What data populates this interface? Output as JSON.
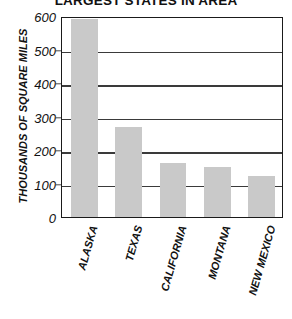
{
  "chart_data": {
    "type": "bar",
    "title": "LARGEST STATES IN AREA",
    "xlabel": "",
    "ylabel": "THOUSANDS OF SQUARE MILES",
    "categories": [
      "ALASKA",
      "TEXAS",
      "CALIFORNIA",
      "MONTANA",
      "NEW MEXICO"
    ],
    "values": [
      590,
      270,
      160,
      148,
      122
    ],
    "ylim": [
      0,
      600
    ],
    "ytick_labels": [
      "600",
      "500",
      "400",
      "300",
      "200",
      "100",
      "0"
    ],
    "ytick_values": [
      600,
      500,
      400,
      300,
      200,
      100,
      0
    ],
    "grid": true,
    "legend": false,
    "series": [
      {
        "name": "Area",
        "values": [
          590,
          270,
          160,
          148,
          122
        ]
      }
    ]
  },
  "style": {
    "bar_fill": "#c9c9c9",
    "gridline_color": "#3a3a3a",
    "frame_color": "#1a1a1a",
    "text_color": "#111111",
    "background": "#ffffff"
  }
}
